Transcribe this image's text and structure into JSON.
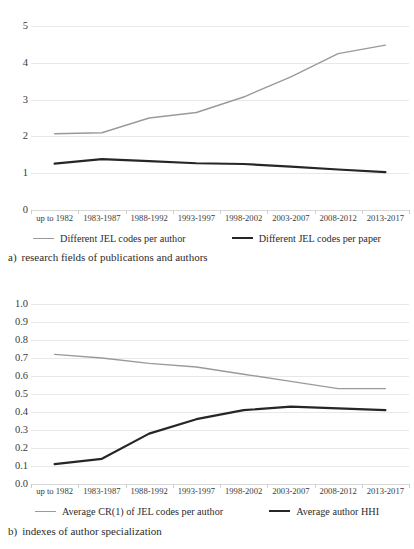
{
  "figure": {
    "panels": [
      {
        "id": "panel-a",
        "caption_tag": "a)",
        "caption_text": "research fields of publications and authors",
        "chart_data": {
          "type": "line",
          "title": "",
          "xlabel": "",
          "ylabel": "",
          "ylim": [
            0,
            5
          ],
          "yticks": [
            "0",
            "1",
            "2",
            "3",
            "4",
            "5"
          ],
          "grid": true,
          "legend_position": "bottom",
          "categories": [
            "up to 1982",
            "1983-1987",
            "1988-1992",
            "1993-1997",
            "1998-2002",
            "2003-2007",
            "2008-2012",
            "2013-2017"
          ],
          "series": [
            {
              "name": "Different JEL codes per author",
              "color": "#9a9a9a",
              "width": 1.4,
              "values": [
                2.07,
                2.1,
                2.5,
                2.65,
                3.07,
                3.62,
                4.25,
                4.48
              ]
            },
            {
              "name": "Different JEL codes per paper",
              "color": "#262626",
              "width": 2.2,
              "values": [
                1.26,
                1.38,
                1.33,
                1.27,
                1.25,
                1.18,
                1.1,
                1.03
              ]
            }
          ]
        }
      },
      {
        "id": "panel-b",
        "caption_tag": "b)",
        "caption_text": "indexes of author specialization",
        "chart_data": {
          "type": "line",
          "title": "",
          "xlabel": "",
          "ylabel": "",
          "ylim": [
            0,
            1
          ],
          "yticks": [
            "0.0",
            "0.1",
            "0.2",
            "0.3",
            "0.4",
            "0.5",
            "0.6",
            "0.7",
            "0.8",
            "0.9",
            "1.0"
          ],
          "grid": true,
          "legend_position": "bottom",
          "categories": [
            "up to 1982",
            "1983-1987",
            "1988-1992",
            "1993-1997",
            "1998-2002",
            "2003-2007",
            "2008-2012",
            "2013-2017"
          ],
          "series": [
            {
              "name": "Average CR(1) of JEL codes per author",
              "color": "#9a9a9a",
              "width": 1.4,
              "values": [
                0.72,
                0.7,
                0.67,
                0.65,
                0.61,
                0.57,
                0.53,
                0.53
              ]
            },
            {
              "name": "Average author HHI",
              "color": "#262626",
              "width": 2.2,
              "values": [
                0.11,
                0.14,
                0.28,
                0.36,
                0.41,
                0.43,
                0.42,
                0.41
              ]
            }
          ]
        }
      }
    ]
  }
}
